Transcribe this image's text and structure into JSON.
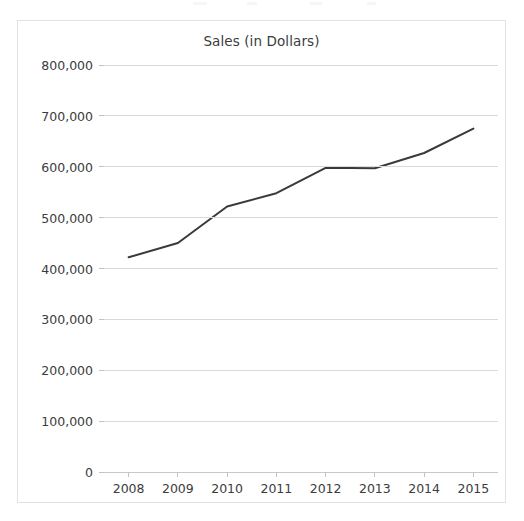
{
  "chart_data": {
    "type": "line",
    "title": "Sales (in Dollars)",
    "xlabel": "",
    "ylabel": "",
    "x": [
      "2008",
      "2009",
      "2010",
      "2011",
      "2012",
      "2013",
      "2014",
      "2015"
    ],
    "categories": [
      "2008",
      "2009",
      "2010",
      "2011",
      "2012",
      "2013",
      "2014",
      "2015"
    ],
    "values": [
      422000,
      450000,
      522000,
      548000,
      598000,
      597000,
      627000,
      675000
    ],
    "series": [
      {
        "name": "Sales",
        "values": [
          422000,
          450000,
          522000,
          548000,
          598000,
          597000,
          627000,
          675000
        ]
      }
    ],
    "ylim": [
      0,
      800000
    ],
    "ytick_values": [
      0,
      100000,
      200000,
      300000,
      400000,
      500000,
      600000,
      700000,
      800000
    ],
    "ytick_labels": [
      "0",
      "100,000",
      "200,000",
      "300,000",
      "400,000",
      "500,000",
      "600,000",
      "700,000",
      "800,000"
    ],
    "xtick_labels": [
      "2008",
      "2009",
      "2010",
      "2011",
      "2012",
      "2013",
      "2014",
      "2015"
    ],
    "grid": true,
    "grid_axis": "y",
    "legend": false,
    "legend_position": "none",
    "line_color": "#3a3a3a",
    "grid_color": "#d9d9dc",
    "text_color": "#3c3c3c",
    "panel_border_color": "#e2e2e4",
    "background_color": "#ffffff"
  }
}
